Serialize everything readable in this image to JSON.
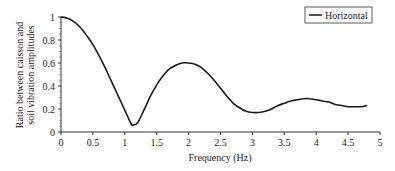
{
  "chart_data": {
    "type": "line",
    "title": "",
    "xlabel": "Frequency (Hz)",
    "ylabel": "Ratio between caisson and soil vibration amplitudes",
    "ylabel_lines": [
      "Ratio between caisson and",
      "soil vibration amplitudes"
    ],
    "xlim": [
      0,
      5
    ],
    "ylim": [
      0,
      1
    ],
    "x_ticks": [
      "0",
      "0.5",
      "1",
      "1.5",
      "2",
      "2.5",
      "3",
      "3.5",
      "4",
      "4.5",
      "5"
    ],
    "y_ticks": [
      "0",
      "0.2",
      "0.4",
      "0.6",
      "0.8",
      "1"
    ],
    "grid": false,
    "legend_position": "top-right",
    "series": [
      {
        "name": "Horizontal",
        "color": "#1a1a1a",
        "x": [
          0,
          0.1,
          0.2,
          0.3,
          0.4,
          0.5,
          0.6,
          0.7,
          0.8,
          0.9,
          1.0,
          1.1,
          1.13,
          1.2,
          1.3,
          1.4,
          1.5,
          1.6,
          1.7,
          1.8,
          1.9,
          2.0,
          2.1,
          2.2,
          2.3,
          2.4,
          2.5,
          2.6,
          2.7,
          2.8,
          2.9,
          3.0,
          3.1,
          3.2,
          3.3,
          3.4,
          3.5,
          3.6,
          3.7,
          3.8,
          3.9,
          4.0,
          4.1,
          4.2,
          4.3,
          4.4,
          4.5,
          4.6,
          4.7,
          4.8
        ],
        "values": [
          1.0,
          0.99,
          0.96,
          0.91,
          0.84,
          0.76,
          0.66,
          0.55,
          0.43,
          0.31,
          0.19,
          0.07,
          0.06,
          0.08,
          0.19,
          0.31,
          0.41,
          0.49,
          0.55,
          0.58,
          0.6,
          0.6,
          0.59,
          0.56,
          0.51,
          0.45,
          0.38,
          0.31,
          0.25,
          0.21,
          0.18,
          0.17,
          0.17,
          0.18,
          0.2,
          0.23,
          0.25,
          0.27,
          0.28,
          0.29,
          0.29,
          0.28,
          0.27,
          0.26,
          0.24,
          0.23,
          0.22,
          0.22,
          0.22,
          0.23
        ]
      }
    ]
  }
}
